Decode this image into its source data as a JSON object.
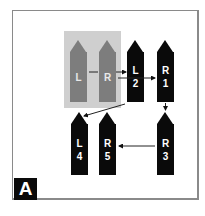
{
  "figure": {
    "panel_label": "A",
    "colors": {
      "black": "#0a0a0a",
      "gray_pointer": "#7d7d7d",
      "gray_box": "#cfcfcf",
      "frame": "#8a8a8a"
    },
    "highlight_group": [
      "L",
      "R"
    ],
    "pointers": [
      {
        "id": "gray-l",
        "side": "L",
        "order": "",
        "color": "gray"
      },
      {
        "id": "gray-r",
        "side": "R",
        "order": "",
        "color": "gray"
      },
      {
        "id": "l2",
        "side": "L",
        "order": "2",
        "color": "black"
      },
      {
        "id": "r1",
        "side": "R",
        "order": "1",
        "color": "black"
      },
      {
        "id": "l4",
        "side": "L",
        "order": "4",
        "color": "black"
      },
      {
        "id": "r5",
        "side": "R",
        "order": "5",
        "color": "black"
      },
      {
        "id": "r3",
        "side": "R",
        "order": "3",
        "color": "black"
      }
    ],
    "arrows": [
      {
        "from": "gray-l",
        "to": "gray-r"
      },
      {
        "from": "gray-r",
        "to": "l2"
      },
      {
        "from": "gray-r",
        "to": "r1"
      },
      {
        "from": "r1",
        "to": "r3"
      },
      {
        "from": "r3",
        "to": "r5"
      },
      {
        "from": "gray-box",
        "to": "l4"
      }
    ]
  }
}
